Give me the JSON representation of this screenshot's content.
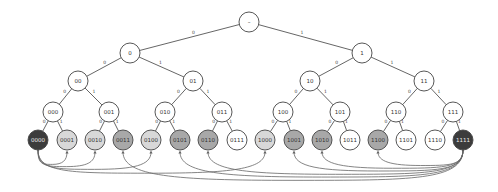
{
  "title": "",
  "colors": {
    "white": "#ffffff",
    "light": "#d8d8d8",
    "medium": "#a8a8a8",
    "dark": "#3c3c3c",
    "stroke": "#444444",
    "text_dark": "#333333",
    "text_light": "#eeeeee"
  },
  "tree": {
    "root": {
      "id": "root",
      "label": "–",
      "x": 249,
      "y": 22,
      "r": 10,
      "fill": "white"
    },
    "nodes": [
      {
        "id": "0",
        "label": "0",
        "x": 130,
        "y": 53,
        "r": 10,
        "fill": "white",
        "parent": "root",
        "edge": "0"
      },
      {
        "id": "1",
        "label": "1",
        "x": 362,
        "y": 53,
        "r": 10,
        "fill": "white",
        "parent": "root",
        "edge": "1"
      },
      {
        "id": "00",
        "label": "00",
        "x": 78,
        "y": 81,
        "r": 10,
        "fill": "white",
        "parent": "0",
        "edge": "0"
      },
      {
        "id": "01",
        "label": "01",
        "x": 193,
        "y": 81,
        "r": 10,
        "fill": "white",
        "parent": "0",
        "edge": "1"
      },
      {
        "id": "10",
        "label": "10",
        "x": 310,
        "y": 81,
        "r": 10,
        "fill": "white",
        "parent": "1",
        "edge": "0"
      },
      {
        "id": "11",
        "label": "11",
        "x": 424,
        "y": 81,
        "r": 10,
        "fill": "white",
        "parent": "1",
        "edge": "1"
      },
      {
        "id": "000",
        "label": "000",
        "x": 53,
        "y": 112,
        "r": 10,
        "fill": "white",
        "parent": "00",
        "edge": "0"
      },
      {
        "id": "001",
        "label": "001",
        "x": 109,
        "y": 112,
        "r": 10,
        "fill": "white",
        "parent": "00",
        "edge": "1"
      },
      {
        "id": "010",
        "label": "010",
        "x": 165,
        "y": 112,
        "r": 10,
        "fill": "white",
        "parent": "01",
        "edge": "0"
      },
      {
        "id": "011",
        "label": "011",
        "x": 222,
        "y": 112,
        "r": 10,
        "fill": "white",
        "parent": "01",
        "edge": "1"
      },
      {
        "id": "100",
        "label": "100",
        "x": 283,
        "y": 112,
        "r": 10,
        "fill": "white",
        "parent": "10",
        "edge": "0"
      },
      {
        "id": "101",
        "label": "101",
        "x": 340,
        "y": 112,
        "r": 10,
        "fill": "white",
        "parent": "10",
        "edge": "1"
      },
      {
        "id": "110",
        "label": "110",
        "x": 396,
        "y": 112,
        "r": 10,
        "fill": "white",
        "parent": "11",
        "edge": "0"
      },
      {
        "id": "111",
        "label": "111",
        "x": 453,
        "y": 112,
        "r": 10,
        "fill": "white",
        "parent": "11",
        "edge": "1"
      },
      {
        "id": "0000",
        "label": "0000",
        "x": 38,
        "y": 140,
        "r": 10,
        "fill": "dark",
        "parent": "000",
        "edge": "0"
      },
      {
        "id": "0001",
        "label": "0001",
        "x": 67,
        "y": 140,
        "r": 10,
        "fill": "light",
        "parent": "000",
        "edge": "1"
      },
      {
        "id": "0010",
        "label": "0010",
        "x": 95,
        "y": 140,
        "r": 10,
        "fill": "light",
        "parent": "001",
        "edge": "0"
      },
      {
        "id": "0011",
        "label": "0011",
        "x": 123,
        "y": 140,
        "r": 10,
        "fill": "medium",
        "parent": "001",
        "edge": "1"
      },
      {
        "id": "0100",
        "label": "0100",
        "x": 151,
        "y": 140,
        "r": 10,
        "fill": "light",
        "parent": "010",
        "edge": "0"
      },
      {
        "id": "0101",
        "label": "0101",
        "x": 180,
        "y": 140,
        "r": 10,
        "fill": "medium",
        "parent": "010",
        "edge": "1"
      },
      {
        "id": "0110",
        "label": "0110",
        "x": 208,
        "y": 140,
        "r": 10,
        "fill": "medium",
        "parent": "011",
        "edge": "0"
      },
      {
        "id": "0111",
        "label": "0111",
        "x": 237,
        "y": 140,
        "r": 10,
        "fill": "white",
        "parent": "011",
        "edge": "1"
      },
      {
        "id": "1000",
        "label": "1000",
        "x": 265,
        "y": 140,
        "r": 10,
        "fill": "light",
        "parent": "100",
        "edge": "0"
      },
      {
        "id": "1001",
        "label": "1001",
        "x": 294,
        "y": 140,
        "r": 10,
        "fill": "medium",
        "parent": "100",
        "edge": "1"
      },
      {
        "id": "1010",
        "label": "1010",
        "x": 322,
        "y": 140,
        "r": 10,
        "fill": "medium",
        "parent": "101",
        "edge": "0"
      },
      {
        "id": "1011",
        "label": "1011",
        "x": 350,
        "y": 140,
        "r": 10,
        "fill": "white",
        "parent": "101",
        "edge": "1"
      },
      {
        "id": "1100",
        "label": "1100",
        "x": 378,
        "y": 140,
        "r": 10,
        "fill": "medium",
        "parent": "110",
        "edge": "0"
      },
      {
        "id": "1101",
        "label": "1101",
        "x": 406,
        "y": 140,
        "r": 10,
        "fill": "white",
        "parent": "110",
        "edge": "1"
      },
      {
        "id": "1110",
        "label": "1110",
        "x": 435,
        "y": 140,
        "r": 10,
        "fill": "white",
        "parent": "111",
        "edge": "0"
      },
      {
        "id": "1111",
        "label": "1111",
        "x": 463,
        "y": 140,
        "r": 10,
        "fill": "dark",
        "parent": "111",
        "edge": "1"
      }
    ]
  },
  "arcs": [
    {
      "from": "0000",
      "to": "0001",
      "depth": 8
    },
    {
      "from": "0000",
      "to": "0010",
      "depth": 12
    },
    {
      "from": "0000",
      "to": "0100",
      "depth": 17
    },
    {
      "from": "0000",
      "to": "1000",
      "depth": 24
    },
    {
      "from": "1111",
      "to": "1100",
      "depth": 10
    },
    {
      "from": "1111",
      "to": "1010",
      "depth": 15
    },
    {
      "from": "1111",
      "to": "1001",
      "depth": 20
    },
    {
      "from": "1111",
      "to": "0110",
      "depth": 26
    },
    {
      "from": "1111",
      "to": "0101",
      "depth": 31
    },
    {
      "from": "1111",
      "to": "0011",
      "depth": 37
    }
  ]
}
